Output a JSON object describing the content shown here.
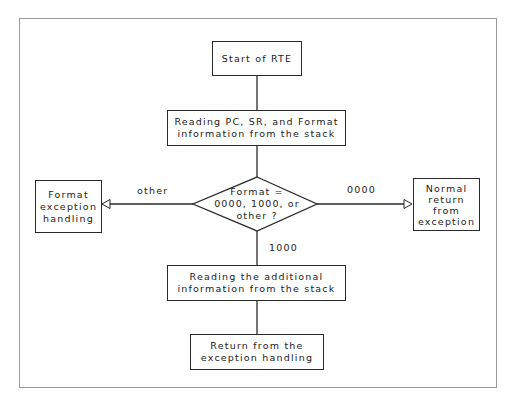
{
  "diagram": {
    "type": "flowchart",
    "nodes": {
      "start": {
        "label": "Start of RTE"
      },
      "read_pc_sr": {
        "label": "Reading PC, SR, and Format\ninformation from the stack"
      },
      "decision": {
        "label": "Format =\n0000, 1000, or\nother ?"
      },
      "format_exception": {
        "label": "Format\nexception\nhandling"
      },
      "normal_return": {
        "label": "Normal\nreturn\nfrom\nexception"
      },
      "read_additional": {
        "label": "Reading the additional\ninformation from the stack"
      },
      "return_handling": {
        "label": "Return from the\nexception handling"
      }
    },
    "edges": {
      "other": {
        "label": "other",
        "from": "decision",
        "to": "format_exception"
      },
      "zero": {
        "label": "0000",
        "from": "decision",
        "to": "normal_return"
      },
      "thousand": {
        "label": "1000",
        "from": "decision",
        "to": "read_additional"
      }
    },
    "colors": {
      "stroke": "#2a2a2a",
      "frame": "#9a9a9a",
      "background": "#ffffff"
    }
  }
}
